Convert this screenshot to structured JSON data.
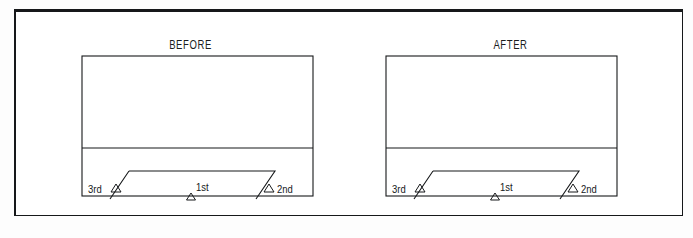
{
  "figure": {
    "background_color": "#ffffff",
    "line_color": "#16181a",
    "caption": ""
  },
  "panels": [
    {
      "id": "before",
      "title": "BEFORE",
      "box": {
        "x": 80,
        "y": 53,
        "width": 231,
        "height": 140
      },
      "divider_y": 145,
      "shape": {
        "type": "parallelogram",
        "top_left_x": 127,
        "top_right_x": 273,
        "top_y": 168,
        "bottom_left_x": 108,
        "bottom_right_x": 254,
        "bottom_y": 196
      },
      "markers": [
        {
          "label": "3rd",
          "name": "marker-3rd",
          "label_x": 86,
          "label_y": 190,
          "tri_x": 114,
          "tri_y": 186
        },
        {
          "label": "1st",
          "name": "marker-1st",
          "label_x": 193,
          "label_y": 188,
          "tri_x": 189,
          "tri_y": 196
        },
        {
          "label": "2nd",
          "name": "marker-2nd",
          "label_x": 277,
          "label_y": 190,
          "tri_x": 267,
          "tri_y": 186
        }
      ]
    },
    {
      "id": "after",
      "title": "AFTER",
      "box": {
        "x": 384,
        "y": 53,
        "width": 231,
        "height": 140
      },
      "divider_y": 145,
      "shape": {
        "type": "parallelogram",
        "top_left_x": 431,
        "top_right_x": 577,
        "top_y": 168,
        "bottom_left_x": 412,
        "bottom_right_x": 558,
        "bottom_y": 196
      },
      "markers": [
        {
          "label": "3rd",
          "name": "marker-3rd",
          "label_x": 390,
          "label_y": 190,
          "tri_x": 418,
          "tri_y": 186
        },
        {
          "label": "1st",
          "name": "marker-1st",
          "label_x": 497,
          "label_y": 188,
          "tri_x": 493,
          "tri_y": 196
        },
        {
          "label": "2nd",
          "name": "marker-2nd",
          "label_x": 581,
          "label_y": 190,
          "tri_x": 571,
          "tri_y": 186
        }
      ]
    }
  ]
}
